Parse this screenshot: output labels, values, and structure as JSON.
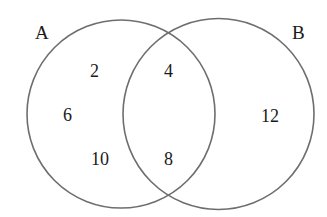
{
  "diagram": {
    "type": "venn",
    "sets": [
      {
        "id": "A",
        "label": "A"
      },
      {
        "id": "B",
        "label": "B"
      }
    ],
    "regions": {
      "a_only": [
        "2",
        "6",
        "10"
      ],
      "a_and_b": [
        "4",
        "8"
      ],
      "b_only": [
        "12"
      ]
    }
  },
  "colors": {
    "stroke": "#6e6e6e",
    "text": "#1a1a1a",
    "background": "#ffffff"
  }
}
